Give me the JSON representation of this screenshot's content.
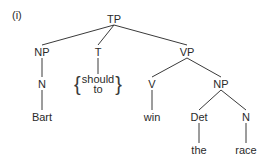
{
  "example_number": "(i)",
  "tree": {
    "TP": "TP",
    "NP_subject": "NP",
    "N_subject": "N",
    "subject_word": "Bart",
    "T": "T",
    "T_options": [
      "should",
      "to"
    ],
    "VP": "VP",
    "V": "V",
    "verb_word": "win",
    "NP_object": "NP",
    "Det": "Det",
    "det_word": "the",
    "N_object": "N",
    "object_word": "race"
  }
}
